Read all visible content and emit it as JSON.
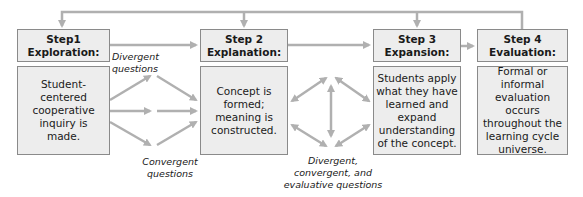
{
  "steps": [
    {
      "title_line1": "Step1",
      "title_line2": "Exploration:",
      "body": "Student-centered cooperative inquiry is made."
    },
    {
      "title_line1": "Step 2",
      "title_line2": "Explanation:",
      "body": "Concept is formed; meaning is constructed."
    },
    {
      "title_line1": "Step 3",
      "title_line2": "Expansion:",
      "body": "Students apply what they have learned and expand understanding of the concept."
    },
    {
      "title_line1": "Step 4",
      "title_line2": "Evaluation:",
      "body": "Formal or informal evaluation occurs throughout the learning cycle universe."
    }
  ],
  "labels": {
    "divergent": "Divergent questions",
    "convergent": "Convergent questions",
    "mixed": "Divergent, convergent, and evaluative questions"
  },
  "colors": {
    "box_fill": "#ededed",
    "box_border": "#8a8a8a",
    "arrow": "#b0b0b0"
  }
}
